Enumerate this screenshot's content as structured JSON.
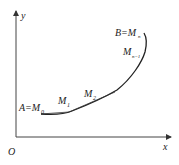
{
  "diagram": {
    "axes": {
      "x_label": "x",
      "y_label": "y",
      "origin_label": "O"
    },
    "points": {
      "start": "A=M",
      "start_sub": "0",
      "m1": "M",
      "m1_sub": "1",
      "m2": "M",
      "m2_sub": "2",
      "mn1": "M",
      "mn1_sub": "n−1",
      "end": "B=M",
      "end_sub": "n"
    }
  }
}
